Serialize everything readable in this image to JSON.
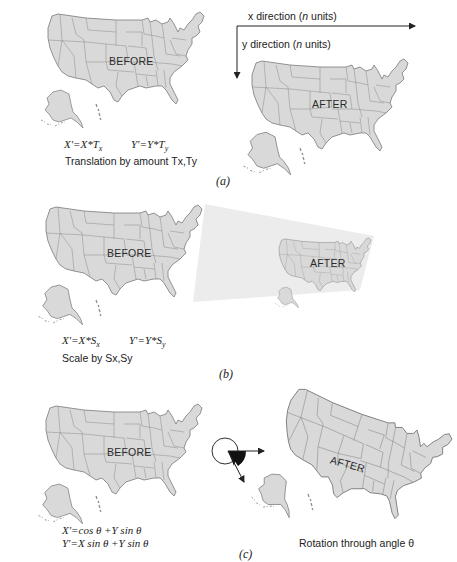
{
  "figure": {
    "panels": [
      {
        "id": "a",
        "label": "(a)",
        "before_label": "BEFORE",
        "after_label": "AFTER",
        "x_axis_label": "x direction (n units)",
        "y_axis_label": "y direction (n units)",
        "equation_x": "X'=X*Tx",
        "equation_y": "Y'=Y*Ty",
        "caption": "Translation by amount Tx,Ty"
      },
      {
        "id": "b",
        "label": "(b)",
        "before_label": "BEFORE",
        "after_label": "AFTER",
        "equation_x": "X'=X*Sx",
        "equation_y": "Y'=Y*Sy",
        "caption": "Scale by Sx,Sy"
      },
      {
        "id": "c",
        "label": "(c)",
        "before_label": "BEFORE",
        "after_label": "AFTER",
        "equation_x": "X'=cos θ +Y sin θ",
        "equation_y": "Y'=X sin θ +Y sin θ",
        "caption": "Rotation through angle θ"
      }
    ],
    "text": {
      "a_x_prefix": "x direction (",
      "a_x_italic": "n",
      "a_x_suffix": " units)",
      "a_y_prefix": "y direction (",
      "a_y_italic": "n",
      "a_y_suffix": " units)",
      "eq_a_x_lhs": "X'=X*T",
      "eq_a_x_sub": "x",
      "eq_a_y_lhs": "Y'=Y*T",
      "eq_a_y_sub": "y",
      "eq_b_x_lhs": "X'=X*S",
      "eq_b_x_sub": "x",
      "eq_b_y_lhs": "Y'=Y*S",
      "eq_b_y_sub": "y",
      "eq_c_1": "X'=cos θ +Y sin θ",
      "eq_c_2": "Y'=X sin θ +Y sin θ"
    },
    "colors": {
      "map_fill": "#d9d9d9",
      "map_stroke": "#7a7a7a",
      "scale_projection": "#ececec",
      "arrow": "#222222"
    }
  }
}
